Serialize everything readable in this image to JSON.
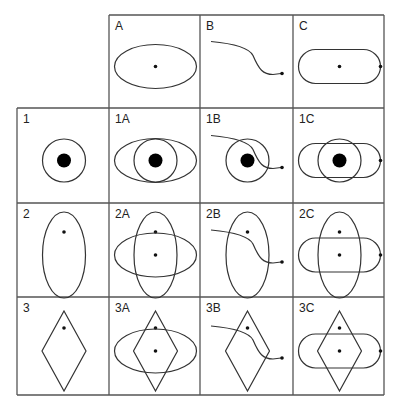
{
  "diagram": {
    "column_headers": [
      "A",
      "B",
      "C"
    ],
    "row_headers": [
      "1",
      "2",
      "3"
    ],
    "cells": [
      {
        "label": "A",
        "row": 0,
        "col": 1,
        "shapes": [
          "ellipse-horizontal"
        ]
      },
      {
        "label": "B",
        "row": 0,
        "col": 2,
        "shapes": [
          "curve"
        ]
      },
      {
        "label": "C",
        "row": 0,
        "col": 3,
        "shapes": [
          "stadium"
        ]
      },
      {
        "label": "1",
        "row": 1,
        "col": 0,
        "shapes": [
          "circle"
        ]
      },
      {
        "label": "1A",
        "row": 1,
        "col": 1,
        "shapes": [
          "circle",
          "ellipse-horizontal"
        ]
      },
      {
        "label": "1B",
        "row": 1,
        "col": 2,
        "shapes": [
          "circle",
          "curve"
        ]
      },
      {
        "label": "1C",
        "row": 1,
        "col": 3,
        "shapes": [
          "circle",
          "stadium"
        ]
      },
      {
        "label": "2",
        "row": 2,
        "col": 0,
        "shapes": [
          "ellipse-vertical"
        ]
      },
      {
        "label": "2A",
        "row": 2,
        "col": 1,
        "shapes": [
          "ellipse-vertical",
          "ellipse-horizontal"
        ]
      },
      {
        "label": "2B",
        "row": 2,
        "col": 2,
        "shapes": [
          "ellipse-vertical",
          "curve"
        ]
      },
      {
        "label": "2C",
        "row": 2,
        "col": 3,
        "shapes": [
          "ellipse-vertical",
          "stadium"
        ]
      },
      {
        "label": "3",
        "row": 3,
        "col": 0,
        "shapes": [
          "diamond"
        ]
      },
      {
        "label": "3A",
        "row": 3,
        "col": 1,
        "shapes": [
          "diamond",
          "ellipse-horizontal"
        ]
      },
      {
        "label": "3B",
        "row": 3,
        "col": 2,
        "shapes": [
          "diamond",
          "curve"
        ]
      },
      {
        "label": "3C",
        "row": 3,
        "col": 3,
        "shapes": [
          "diamond",
          "stadium"
        ]
      }
    ]
  }
}
